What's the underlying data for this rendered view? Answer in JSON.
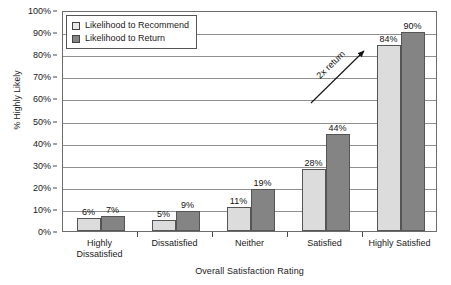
{
  "chart_data": {
    "type": "bar",
    "title": "",
    "xlabel": "Overall Satisfaction Rating",
    "ylabel": "% Highly Likely",
    "categories": [
      "Highly Dissatisfied",
      "Dissatisfied",
      "Neither",
      "Satisfied",
      "Highly Satisfied"
    ],
    "category_lines": [
      [
        "Highly",
        "Dissatisfied"
      ],
      [
        "Dissatisfied"
      ],
      [
        "Neither"
      ],
      [
        "Satisfied"
      ],
      [
        "Highly Satisfied"
      ]
    ],
    "series": [
      {
        "name": "Likelihood to Recommend",
        "color": "#dcdcdc",
        "values": [
          6,
          5,
          11,
          28,
          84
        ],
        "labels": [
          "6%",
          "5%",
          "11%",
          "28%",
          "84%"
        ]
      },
      {
        "name": "Likelihood to Return",
        "color": "#848484",
        "values": [
          7,
          9,
          19,
          44,
          90
        ],
        "labels": [
          "7%",
          "9%",
          "19%",
          "44%",
          "90%"
        ]
      }
    ],
    "ylim": [
      0,
      100
    ],
    "ytick_values": [
      0,
      10,
      20,
      30,
      40,
      50,
      60,
      70,
      80,
      90,
      100
    ],
    "ytick_labels": [
      "0%",
      "10%",
      "20%",
      "30%",
      "40%",
      "50%",
      "60%",
      "70%",
      "80%",
      "90%",
      "100%"
    ],
    "grid": true,
    "legend_position": "top-left",
    "annotations": [
      {
        "text": "2x return",
        "type": "arrow",
        "direction": "up-right"
      }
    ]
  },
  "legend": {
    "items": [
      {
        "label": "Likelihood to Recommend"
      },
      {
        "label": "Likelihood to Return"
      }
    ]
  },
  "annotation": {
    "label": "2x return"
  }
}
